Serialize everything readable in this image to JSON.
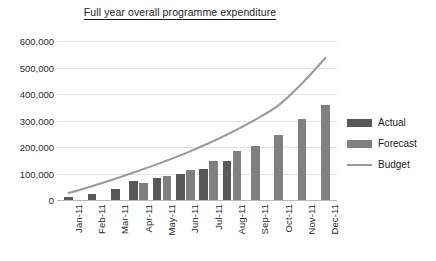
{
  "chart_data": {
    "type": "bar",
    "title": "Full year overall programme expenditure",
    "xlabel": "",
    "ylabel": "",
    "ylim": [
      0,
      600000
    ],
    "ytick_values": [
      0,
      100000,
      200000,
      300000,
      400000,
      500000,
      600000
    ],
    "ytick_labels": [
      "0",
      "100,000",
      "200,000",
      "300,000",
      "400,000",
      "500,000",
      "600,000"
    ],
    "categories": [
      "Jan-11",
      "Feb-11",
      "Mar-11",
      "Apr-11",
      "May-11",
      "Jun-11",
      "Jul-11",
      "Aug-11",
      "Sep-11",
      "Oct-11",
      "Nov-11",
      "Dec-11"
    ],
    "grid": true,
    "legend_position": "right",
    "series": [
      {
        "name": "Actual",
        "type": "bar",
        "color": "#595959",
        "values": [
          13000,
          24000,
          43000,
          72000,
          84000,
          98000,
          118000,
          149000,
          null,
          null,
          null,
          null
        ]
      },
      {
        "name": "Forecast",
        "type": "bar",
        "color": "#808080",
        "values": [
          null,
          null,
          null,
          66000,
          90000,
          114000,
          148000,
          184000,
          205000,
          245000,
          307000,
          360000
        ]
      },
      {
        "name": "Budget",
        "type": "line",
        "color": "#9a9a9a",
        "values": [
          26000,
          52000,
          80000,
          110000,
          142000,
          176000,
          214000,
          256000,
          303000,
          358000,
          440000,
          536000
        ]
      }
    ]
  },
  "legend": {
    "items": [
      {
        "label": "Actual",
        "marker": "swatch",
        "color": "#595959"
      },
      {
        "label": "Forecast",
        "marker": "swatch",
        "color": "#808080"
      },
      {
        "label": "Budget",
        "marker": "line",
        "color": "#9a9a9a"
      }
    ]
  }
}
